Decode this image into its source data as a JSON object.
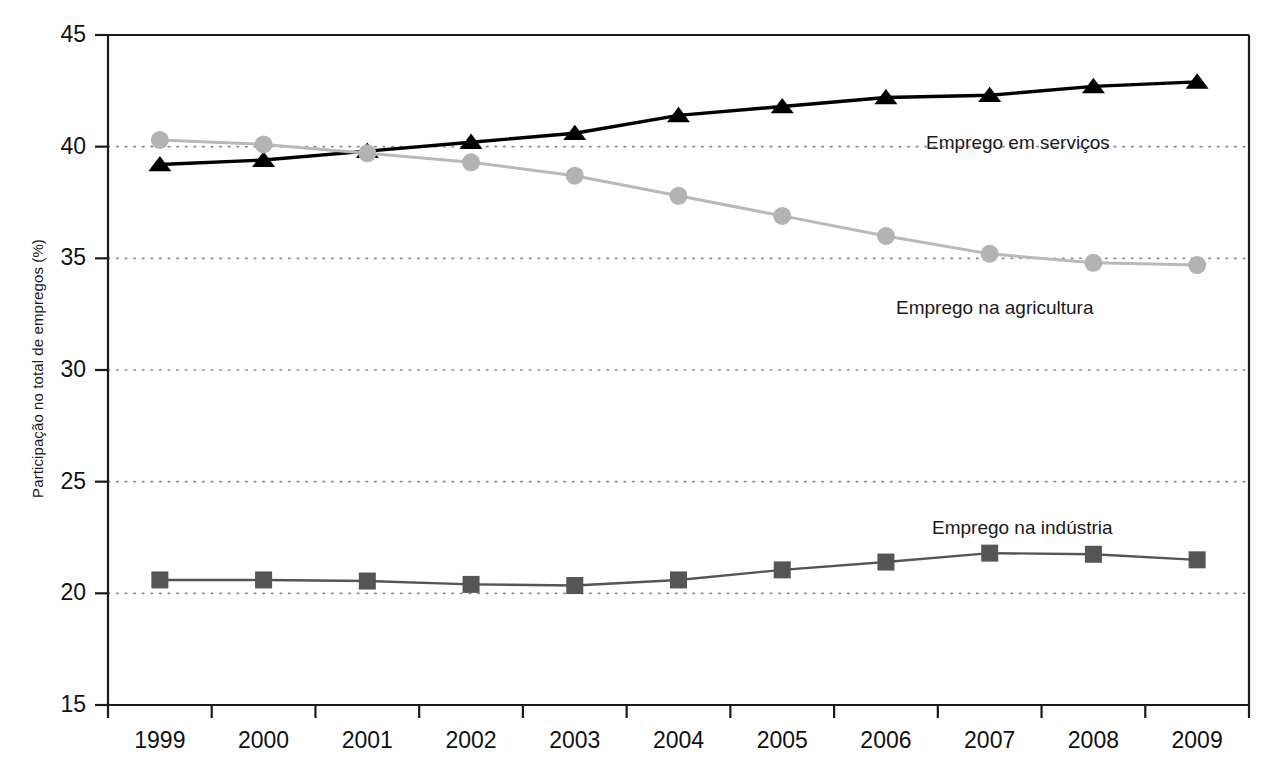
{
  "chart_data": {
    "type": "line",
    "title": "",
    "subtitle": "",
    "xlabel": "",
    "ylabel": "Participação no total de empregos (%)",
    "categories": [
      "1999",
      "2000",
      "2001",
      "2002",
      "2003",
      "2004",
      "2005",
      "2006",
      "2007",
      "2008",
      "2009"
    ],
    "x": [
      1999,
      2000,
      2001,
      2002,
      2003,
      2004,
      2005,
      2006,
      2007,
      2008,
      2009
    ],
    "xlim": [
      1999,
      2009
    ],
    "ylim": [
      15,
      45
    ],
    "yticks": [
      15,
      20,
      25,
      30,
      35,
      40,
      45
    ],
    "ytick_labels": [
      "15",
      "20",
      "25",
      "30",
      "35",
      "40",
      "45"
    ],
    "grid": true,
    "grid_style": "dotted-horizontal",
    "legend": "inline-annotations",
    "series": [
      {
        "name": "Emprego em serviços",
        "marker": "triangle",
        "color": "#000000",
        "line_color": "#000000",
        "values": [
          39.2,
          39.4,
          39.8,
          40.2,
          40.6,
          41.4,
          41.8,
          42.2,
          42.3,
          42.7,
          42.9
        ]
      },
      {
        "name": "Emprego na agricultura",
        "marker": "circle",
        "color": "#b3b3b3",
        "line_color": "#b9b9b9",
        "values": [
          40.3,
          40.1,
          39.7,
          39.3,
          38.7,
          37.8,
          36.9,
          36.0,
          35.2,
          34.8,
          34.7
        ]
      },
      {
        "name": "Emprego na indústria",
        "marker": "square",
        "color": "#555555",
        "line_color": "#555555",
        "values": [
          20.6,
          20.6,
          20.55,
          20.4,
          20.35,
          20.6,
          21.05,
          21.4,
          21.8,
          21.75,
          21.5
        ]
      }
    ],
    "annotations": [
      {
        "text": "Emprego em serviços",
        "series": "Emprego em serviços",
        "x_px": 926,
        "y_px": 133
      },
      {
        "text": "Emprego na agricultura",
        "series": "Emprego na agricultura",
        "x_px": 896,
        "y_px": 298
      },
      {
        "text": "Emprego na indústria",
        "series": "Emprego na indústria",
        "x_px": 932,
        "y_px": 518
      }
    ],
    "colors": {
      "axis": "#1a1a1a",
      "grid": "#8c8c8c",
      "services": "#000000",
      "agriculture": "#b3b3b3",
      "industry": "#555555",
      "background": "#ffffff"
    }
  }
}
